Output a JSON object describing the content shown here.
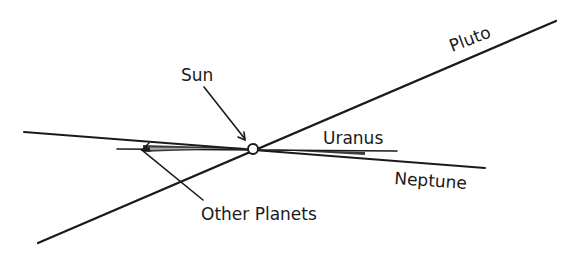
{
  "diagram": {
    "type": "orbital-planes",
    "labels": {
      "sun": "Sun",
      "pluto": "Pluto",
      "uranus": "Uranus",
      "neptune": "Neptune",
      "other_planets": "Other Planets"
    },
    "colors": {
      "ink": "#1a1a1a",
      "background": "#ffffff"
    }
  }
}
